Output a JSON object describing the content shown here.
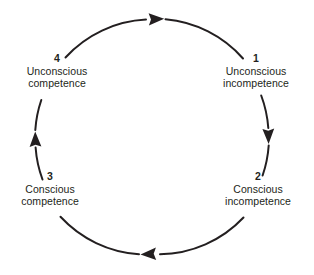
{
  "diagram": {
    "type": "cycle",
    "direction": "clockwise",
    "colors": {
      "stroke": "#231f20",
      "text": "#231f20",
      "background": "#ffffff"
    },
    "geometry": {
      "center_x": 152,
      "center_y": 137,
      "radius": 117
    },
    "stages": [
      {
        "number": "1",
        "line1": "Unconscious",
        "line2": "incompetence",
        "position": "top-right"
      },
      {
        "number": "2",
        "line1": "Conscious",
        "line2": "incompetence",
        "position": "bottom-right"
      },
      {
        "number": "3",
        "line1": "Conscious",
        "line2": "competence",
        "position": "bottom-left"
      },
      {
        "number": "4",
        "line1": "Unconscious",
        "line2": "competence",
        "position": "top-left"
      }
    ],
    "arrows": [
      {
        "name": "arrow-top",
        "direction": "right",
        "from_stage": "4",
        "to_stage": "1"
      },
      {
        "name": "arrow-right",
        "direction": "down",
        "from_stage": "1",
        "to_stage": "2"
      },
      {
        "name": "arrow-bottom",
        "direction": "left",
        "from_stage": "2",
        "to_stage": "3"
      },
      {
        "name": "arrow-left",
        "direction": "up",
        "from_stage": "3",
        "to_stage": "4"
      }
    ]
  }
}
